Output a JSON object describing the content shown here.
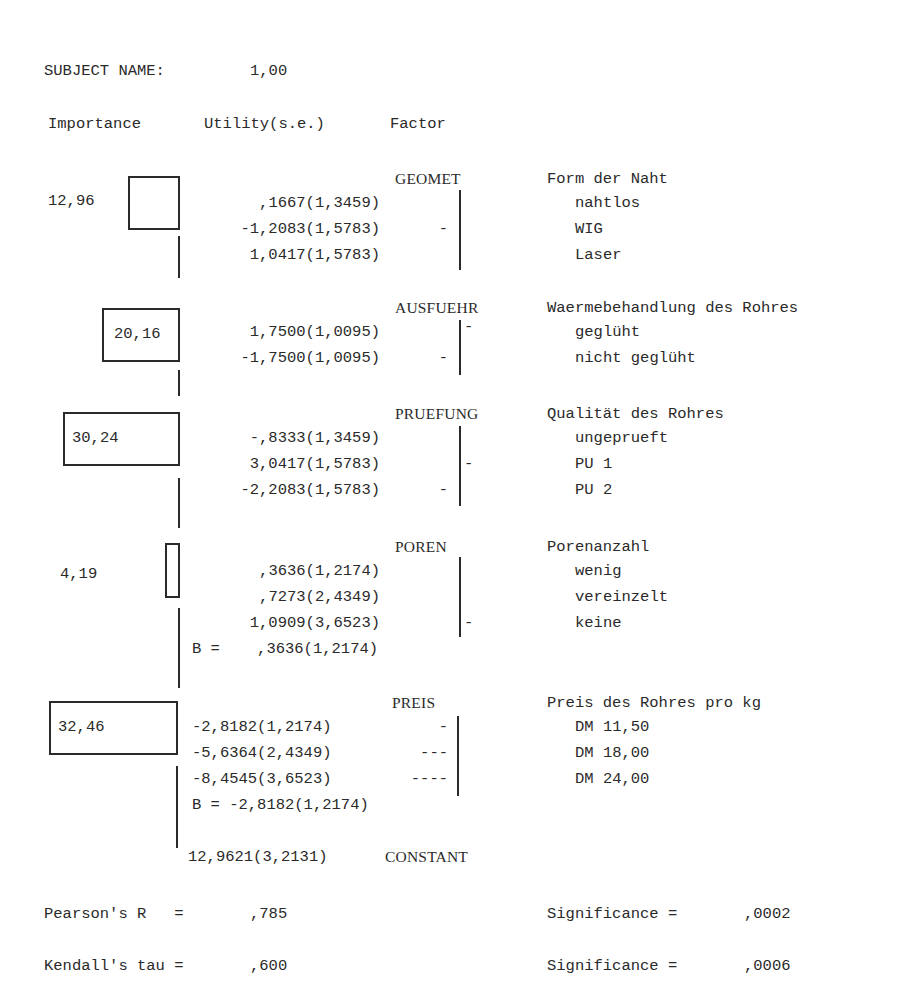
{
  "header": {
    "subject_label": "SUBJECT NAME:",
    "subject_value": "1,00",
    "col_importance": "Importance",
    "col_utility": "Utility(s.e.)",
    "col_factor": "Factor"
  },
  "factors": [
    {
      "code": "GEOMET",
      "description": "Form der Naht",
      "importance": "12,96",
      "levels": [
        {
          "utility": ",1667(1,3459)",
          "label": "nahtlos",
          "left_bar": "",
          "right_bar": ""
        },
        {
          "utility": "-1,2083(1,5783)",
          "label": "WIG",
          "left_bar": "-",
          "right_bar": ""
        },
        {
          "utility": "1,0417(1,5783)",
          "label": "Laser",
          "left_bar": "",
          "right_bar": ""
        }
      ]
    },
    {
      "code": "AUSFUEHR",
      "description": "Waermebehandlung des Rohres",
      "importance": "20,16",
      "levels": [
        {
          "utility": "1,7500(1,0095)",
          "label": "geglüht",
          "left_bar": "",
          "right_bar": "-"
        },
        {
          "utility": "-1,7500(1,0095)",
          "label": "nicht geglüht",
          "left_bar": "-",
          "right_bar": ""
        }
      ]
    },
    {
      "code": "PRUEFUNG",
      "description": "Qualität des Rohres",
      "importance": "30,24",
      "levels": [
        {
          "utility": "-,8333(1,3459)",
          "label": "ungeprueft",
          "left_bar": "",
          "right_bar": ""
        },
        {
          "utility": "3,0417(1,5783)",
          "label": "PU 1",
          "left_bar": "",
          "right_bar": "-"
        },
        {
          "utility": "-2,2083(1,5783)",
          "label": "PU 2",
          "left_bar": "-",
          "right_bar": ""
        }
      ]
    },
    {
      "code": "POREN",
      "description": "Porenanzahl",
      "importance": "4,19",
      "levels": [
        {
          "utility": ",3636(1,2174)",
          "label": "wenig",
          "left_bar": "",
          "right_bar": ""
        },
        {
          "utility": ",7273(2,4349)",
          "label": "vereinzelt",
          "left_bar": "",
          "right_bar": ""
        },
        {
          "utility": "1,0909(3,6523)",
          "label": "keine",
          "left_bar": "",
          "right_bar": "-"
        }
      ],
      "b_line": "B =    ,3636(1,2174)"
    },
    {
      "code": "PREIS",
      "description": "Preis des Rohres pro kg",
      "importance": "32,46",
      "levels": [
        {
          "utility": "-2,8182(1,2174)",
          "label": "DM 11,50",
          "left_bar": "-",
          "right_bar": ""
        },
        {
          "utility": "-5,6364(2,4349)",
          "label": "DM 18,00",
          "left_bar": "---",
          "right_bar": ""
        },
        {
          "utility": "-8,4545(3,6523)",
          "label": "DM 24,00",
          "left_bar": "----",
          "right_bar": ""
        }
      ],
      "b_line": "B = -2,8182(1,2174)"
    }
  ],
  "constant": {
    "value": "12,9621(3,2131)",
    "label": "CONSTANT"
  },
  "statistics": {
    "pearson_label": "Pearson's R   =",
    "pearson_value": ",785",
    "pearson_sig_label": "Significance =",
    "pearson_sig_value": ",0002",
    "kendall_label": "Kendall's tau =",
    "kendall_value": ",600",
    "kendall_sig_label": "Significance =",
    "kendall_sig_value": ",0006"
  }
}
